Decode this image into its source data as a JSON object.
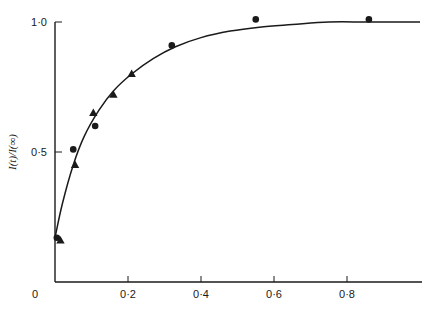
{
  "chart_data": {
    "type": "scatter",
    "title": "",
    "xlabel": "",
    "ylabel": "I(t)/I(∞)",
    "xlim": [
      0,
      1.0
    ],
    "ylim": [
      0,
      1.0
    ],
    "grid": false,
    "legend": null,
    "x_ticks": [
      {
        "value": 0,
        "label": "0"
      },
      {
        "value": 0.2,
        "label": "0·2"
      },
      {
        "value": 0.4,
        "label": "0·4"
      },
      {
        "value": 0.6,
        "label": "0·6"
      },
      {
        "value": 0.8,
        "label": "0·8"
      }
    ],
    "y_ticks": [
      {
        "value": 0.5,
        "label": "0·5"
      },
      {
        "value": 1.0,
        "label": "1·0"
      }
    ],
    "series": [
      {
        "name": "circles",
        "marker": "circle",
        "points": [
          {
            "x": 0.005,
            "y": 0.17
          },
          {
            "x": 0.05,
            "y": 0.51
          },
          {
            "x": 0.11,
            "y": 0.6
          },
          {
            "x": 0.32,
            "y": 0.91
          },
          {
            "x": 0.55,
            "y": 1.01
          },
          {
            "x": 0.86,
            "y": 1.01
          }
        ]
      },
      {
        "name": "triangles",
        "marker": "triangle",
        "points": [
          {
            "x": 0.015,
            "y": 0.16
          },
          {
            "x": 0.055,
            "y": 0.45
          },
          {
            "x": 0.105,
            "y": 0.65
          },
          {
            "x": 0.16,
            "y": 0.72
          },
          {
            "x": 0.21,
            "y": 0.8
          }
        ]
      },
      {
        "name": "fitted curve",
        "marker": "line",
        "points": [
          {
            "x": 0.0,
            "y": 0.17
          },
          {
            "x": 0.02,
            "y": 0.3
          },
          {
            "x": 0.05,
            "y": 0.45
          },
          {
            "x": 0.08,
            "y": 0.56
          },
          {
            "x": 0.12,
            "y": 0.66
          },
          {
            "x": 0.16,
            "y": 0.735
          },
          {
            "x": 0.21,
            "y": 0.8
          },
          {
            "x": 0.27,
            "y": 0.86
          },
          {
            "x": 0.33,
            "y": 0.905
          },
          {
            "x": 0.4,
            "y": 0.94
          },
          {
            "x": 0.48,
            "y": 0.965
          },
          {
            "x": 0.56,
            "y": 0.98
          },
          {
            "x": 0.65,
            "y": 0.99
          },
          {
            "x": 0.75,
            "y": 1.0
          },
          {
            "x": 0.86,
            "y": 1.0
          },
          {
            "x": 1.0,
            "y": 1.0
          }
        ]
      }
    ]
  },
  "colors": {
    "ink": "#1a1a1a",
    "background": "#ffffff"
  }
}
